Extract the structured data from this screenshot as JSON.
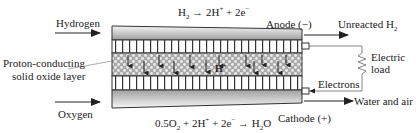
{
  "diagram": {
    "inputs": {
      "top": "Hydrogen",
      "bottom": "Oxygen"
    },
    "outputs": {
      "top": "Unreacted H",
      "top_sub": "2",
      "bottom": "Water and air"
    },
    "electrodes": {
      "anode": "Anode (−)",
      "cathode": "Cathode (+)"
    },
    "layer_label_line1": "Proton-conducting",
    "layer_label_line2": "solid oxide layer",
    "ion_label": "H",
    "ion_sup": "+",
    "circuit": {
      "load_line1": "Electric",
      "load_line2": "load",
      "electrons": "Electrons"
    },
    "equations": {
      "anode": {
        "lhs": "H",
        "lhs_sub": "2",
        "arrow": "→",
        "rhs_a": " 2H",
        "rhs_a_sup": "+",
        "rhs_b": " + 2e",
        "rhs_b_sup": "−"
      },
      "cathode": {
        "lhs_a": "0.5O",
        "lhs_a_sub": "2",
        "lhs_b": " + 2H",
        "lhs_b_sup": "+",
        "lhs_c": " + 2e",
        "lhs_c_sup": "−",
        "arrow": " → ",
        "rhs": "H",
        "rhs_sub": "2",
        "rhs_end": "O"
      }
    },
    "colors": {
      "line": "#222222",
      "hatch_bg": "#b8b8b8",
      "hatch_dot": "#e8e8e8",
      "gradient_dark": "#9a9a9a",
      "gradient_light": "#f4f4f4"
    }
  }
}
